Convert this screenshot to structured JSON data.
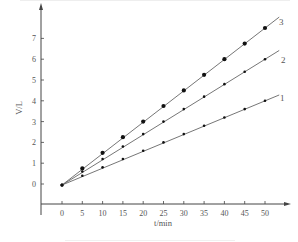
{
  "chart_data": {
    "type": "line",
    "title": "",
    "xlabel": "t/min",
    "ylabel": "V/L",
    "xlim": [
      0,
      55
    ],
    "ylim": [
      -1,
      8
    ],
    "grid": false,
    "legend": "inline labels at line ends",
    "x_ticks": [
      0,
      5,
      10,
      15,
      20,
      25,
      30,
      35,
      40,
      45,
      50
    ],
    "y_ticks": [
      0,
      1,
      2,
      3,
      4,
      5,
      6,
      7
    ],
    "x": [
      0,
      5,
      10,
      15,
      20,
      25,
      30,
      35,
      40,
      45,
      50
    ],
    "series": [
      {
        "name": "1",
        "marker": "small dot",
        "values": [
          0,
          0.4,
          0.8,
          1.2,
          1.6,
          2.0,
          2.4,
          2.8,
          3.2,
          3.6,
          4.0
        ]
      },
      {
        "name": "2",
        "marker": "small dot",
        "values": [
          0,
          0.6,
          1.2,
          1.8,
          2.4,
          3.0,
          3.6,
          4.2,
          4.8,
          5.4,
          6.0
        ]
      },
      {
        "name": "3",
        "marker": "large dot",
        "values": [
          0,
          0.75,
          1.5,
          2.25,
          3.0,
          3.75,
          4.5,
          5.25,
          6.0,
          6.75,
          7.5
        ]
      }
    ]
  },
  "labels": {
    "xlabel": "t/min",
    "ylabel": "V/L",
    "series_1": "1",
    "series_2": "2",
    "series_3": "3"
  }
}
